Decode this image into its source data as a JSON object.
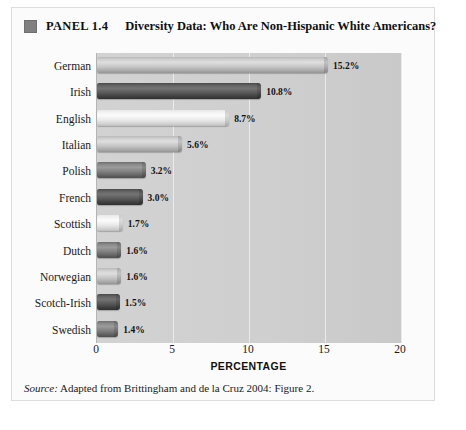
{
  "panel": {
    "marker_icon": "square-marker-icon",
    "number": "PANEL 1.4",
    "title": "Diversity Data: Who Are Non-Hispanic White Americans?"
  },
  "source": {
    "label": "Source:",
    "text": " Adapted from Brittingham and de la Cruz 2004: Figure 2."
  },
  "chart_data": {
    "type": "bar",
    "orientation": "horizontal",
    "title": "Diversity Data: Who Are Non-Hispanic White Americans?",
    "xlabel": "PERCENTAGE",
    "ylabel": "",
    "xlim": [
      0,
      20
    ],
    "xticks": [
      "0",
      "5",
      "10",
      "15",
      "20"
    ],
    "xtick_values": [
      0,
      5,
      10,
      15,
      20
    ],
    "grid": true,
    "grid_axis": "x",
    "legend": "none",
    "categories": [
      "German",
      "Irish",
      "English",
      "Italian",
      "Polish",
      "French",
      "Scottish",
      "Dutch",
      "Norwegian",
      "Scotch-Irish",
      "Swedish"
    ],
    "values": [
      15.2,
      10.8,
      8.7,
      5.6,
      3.2,
      3.0,
      1.7,
      1.6,
      1.6,
      1.5,
      1.4
    ],
    "data_labels": [
      "15.2%",
      "10.8%",
      "8.7%",
      "5.6%",
      "3.2%",
      "3.0%",
      "1.7%",
      "1.6%",
      "1.6%",
      "1.5%",
      "1.4%"
    ],
    "bar_shades": [
      "mid",
      "darker",
      "light",
      "mid",
      "dark",
      "darker",
      "light",
      "dark",
      "mid",
      "darker",
      "dark"
    ]
  },
  "colors": {
    "plot_background": "#cfcfcf",
    "panel_background": "#fbfbfb",
    "gridline": "#eceaea",
    "text": "#111111",
    "marker": "#808080"
  }
}
